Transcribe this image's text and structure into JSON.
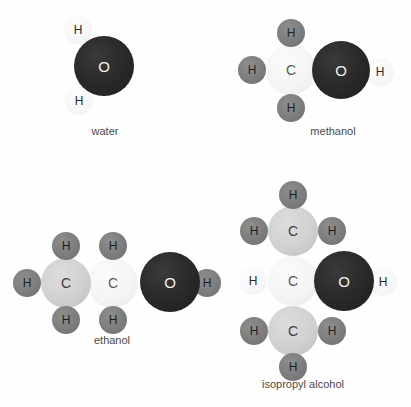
{
  "figure": {
    "type": "molecular-structure-diagram",
    "background_color": "#fefefe",
    "colors": {
      "oxygen": "#2b2b2b",
      "carbon_medium": "#d2d2d2",
      "carbon_light": "#f4f4f4",
      "hydrogen_dark": "#7e7e7e",
      "hydrogen_pale": "#f7f7f7",
      "label_text": "#4a4a4a"
    }
  },
  "molecules": [
    {
      "name": "water",
      "label": "water",
      "label_x": 105,
      "label_y": 125,
      "atoms": [
        {
          "element": "H",
          "symbol": "H",
          "style": "h-pale",
          "cx": 78,
          "cy": 30,
          "r": 14
        },
        {
          "element": "H",
          "symbol": "H",
          "style": "h-pale",
          "cx": 79,
          "cy": 101,
          "r": 14
        },
        {
          "element": "O",
          "symbol": "O",
          "style": "o",
          "cx": 104,
          "cy": 66,
          "r": 30
        }
      ]
    },
    {
      "name": "methanol",
      "label": "methanol",
      "label_x": 333,
      "label_y": 125,
      "atoms": [
        {
          "element": "H",
          "symbol": "H",
          "style": "h-dark",
          "cx": 291,
          "cy": 33,
          "r": 14
        },
        {
          "element": "H",
          "symbol": "H",
          "style": "h-dark",
          "cx": 252,
          "cy": 70,
          "r": 14
        },
        {
          "element": "H",
          "symbol": "H",
          "style": "h-dark",
          "cx": 291,
          "cy": 108,
          "r": 14
        },
        {
          "element": "C",
          "symbol": "C",
          "style": "c-light",
          "cx": 291,
          "cy": 70,
          "r": 25
        },
        {
          "element": "O",
          "symbol": "O",
          "style": "o",
          "cx": 341,
          "cy": 70,
          "r": 29
        },
        {
          "element": "H",
          "symbol": "H",
          "style": "h-pale",
          "cx": 380,
          "cy": 72,
          "r": 14
        }
      ]
    },
    {
      "name": "ethanol",
      "label": "ethanol",
      "label_x": 112,
      "label_y": 334,
      "atoms": [
        {
          "element": "H",
          "symbol": "H",
          "style": "h-dark",
          "cx": 66,
          "cy": 246,
          "r": 14
        },
        {
          "element": "H",
          "symbol": "H",
          "style": "h-dark",
          "cx": 27,
          "cy": 283,
          "r": 14
        },
        {
          "element": "H",
          "symbol": "H",
          "style": "h-dark",
          "cx": 66,
          "cy": 320,
          "r": 14
        },
        {
          "element": "C",
          "symbol": "C",
          "style": "c-med",
          "cx": 66,
          "cy": 283,
          "r": 25
        },
        {
          "element": "H",
          "symbol": "H",
          "style": "h-dark",
          "cx": 113,
          "cy": 246,
          "r": 14
        },
        {
          "element": "H",
          "symbol": "H",
          "style": "h-dark",
          "cx": 113,
          "cy": 320,
          "r": 14
        },
        {
          "element": "C",
          "symbol": "C",
          "style": "c-light",
          "cx": 113,
          "cy": 283,
          "r": 25
        },
        {
          "element": "O",
          "symbol": "O",
          "style": "o",
          "cx": 170,
          "cy": 282,
          "r": 30
        },
        {
          "element": "H",
          "symbol": "H",
          "style": "h-dark",
          "cx": 207,
          "cy": 283,
          "r": 14
        }
      ]
    },
    {
      "name": "isopropyl alcohol",
      "label": "isopropyl alcohol",
      "label_x": 303,
      "label_y": 378,
      "atoms": [
        {
          "element": "H",
          "symbol": "H",
          "style": "h-dark",
          "cx": 293,
          "cy": 195,
          "r": 14
        },
        {
          "element": "H",
          "symbol": "H",
          "style": "h-dark",
          "cx": 254,
          "cy": 231,
          "r": 14
        },
        {
          "element": "H",
          "symbol": "H",
          "style": "h-dark",
          "cx": 332,
          "cy": 231,
          "r": 14
        },
        {
          "element": "C",
          "symbol": "C",
          "style": "c-med",
          "cx": 293,
          "cy": 231,
          "r": 25
        },
        {
          "element": "H",
          "symbol": "H",
          "style": "h-pale",
          "cx": 253,
          "cy": 281,
          "r": 14
        },
        {
          "element": "C",
          "symbol": "C",
          "style": "c-light",
          "cx": 293,
          "cy": 281,
          "r": 25
        },
        {
          "element": "O",
          "symbol": "O",
          "style": "o",
          "cx": 344,
          "cy": 281,
          "r": 30
        },
        {
          "element": "H",
          "symbol": "H",
          "style": "h-pale",
          "cx": 383,
          "cy": 282,
          "r": 14
        },
        {
          "element": "H",
          "symbol": "H",
          "style": "h-dark",
          "cx": 254,
          "cy": 331,
          "r": 14
        },
        {
          "element": "H",
          "symbol": "H",
          "style": "h-dark",
          "cx": 332,
          "cy": 331,
          "r": 14
        },
        {
          "element": "C",
          "symbol": "C",
          "style": "c-med",
          "cx": 293,
          "cy": 331,
          "r": 25
        },
        {
          "element": "H",
          "symbol": "H",
          "style": "h-dark",
          "cx": 293,
          "cy": 367,
          "r": 14
        }
      ]
    }
  ]
}
